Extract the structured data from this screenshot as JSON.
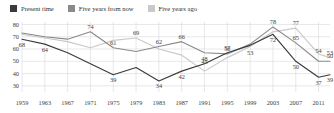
{
  "legend": {
    "items": [
      {
        "label": "Present time",
        "color": "#3b3b3b",
        "key": "present"
      },
      {
        "label": "Five years from now",
        "color": "#8a8a8a",
        "key": "future"
      },
      {
        "label": "Five years ago",
        "color": "#c9c9c9",
        "key": "past"
      }
    ]
  },
  "chart_data": {
    "type": "line",
    "title": "",
    "subtitle": "",
    "xlabel": "",
    "ylabel": "",
    "grid": true,
    "legend_position": "top-left",
    "xlim": [
      1959,
      2013
    ],
    "ylim": [
      25,
      82
    ],
    "yticks": [
      30,
      40,
      50,
      60,
      70,
      80
    ],
    "xticks": [
      1959,
      1963,
      1967,
      1971,
      1975,
      1979,
      1983,
      1987,
      1991,
      1995,
      1999,
      2003,
      2007,
      2011
    ],
    "x": [
      1959,
      1963,
      1967,
      1971,
      1975,
      1979,
      1983,
      1987,
      1991,
      1995,
      1999,
      2003,
      2007,
      2011,
      2013
    ],
    "series": [
      {
        "name": "Present time",
        "color": "#3b3b3b",
        "values": [
          68,
          64,
          57,
          48,
          39,
          45,
          34,
          42,
          48,
          57,
          63,
          72,
          50,
          37,
          39
        ]
      },
      {
        "name": "Five years from now",
        "color": "#8a8a8a",
        "values": [
          73,
          70,
          68,
          74,
          61,
          58,
          62,
          66,
          57,
          56,
          64,
          78,
          65,
          50,
          50
        ]
      },
      {
        "name": "Five years ago",
        "color": "#c9c9c9",
        "values": [
          72,
          69,
          66,
          61,
          67,
          69,
          60,
          55,
          42,
          53,
          62,
          74,
          77,
          56,
          53
        ]
      }
    ],
    "point_labels": [
      {
        "series": "Present time",
        "year": 1959,
        "value": 68,
        "text": "68"
      },
      {
        "series": "Present time",
        "year": 1963,
        "value": 64,
        "text": "64"
      },
      {
        "series": "Present time",
        "year": 1975,
        "value": 39,
        "text": "39"
      },
      {
        "series": "Present time",
        "year": 1983,
        "value": 34,
        "text": "34"
      },
      {
        "series": "Present time",
        "year": 1987,
        "value": 42,
        "text": "42"
      },
      {
        "series": "Present time",
        "year": 2003,
        "value": 72,
        "text": "72"
      },
      {
        "series": "Present time",
        "year": 2007,
        "value": 50,
        "text": "50"
      },
      {
        "series": "Present time",
        "year": 2011,
        "value": 37,
        "text": "37"
      },
      {
        "series": "Present time",
        "year": 2013,
        "value": 39,
        "text": "39"
      },
      {
        "series": "Five years from now",
        "year": 1971,
        "value": 74,
        "text": "74"
      },
      {
        "series": "Five years from now",
        "year": 1975,
        "value": 61,
        "text": "61"
      },
      {
        "series": "Five years from now",
        "year": 1987,
        "value": 66,
        "text": "66"
      },
      {
        "series": "Five years from now",
        "year": 1995,
        "value": 56,
        "text": "56"
      },
      {
        "series": "Five years from now",
        "year": 2003,
        "value": 78,
        "text": "78"
      },
      {
        "series": "Five years from now",
        "year": 2007,
        "value": 65,
        "text": "65"
      },
      {
        "series": "Five years from now",
        "year": 2013,
        "value": 50,
        "text": "50"
      },
      {
        "series": "Five years ago",
        "year": 1979,
        "value": 69,
        "text": "69"
      },
      {
        "series": "Five years ago",
        "year": 1983,
        "value": 62,
        "text": "62"
      },
      {
        "series": "Five years ago",
        "year": 1991,
        "value": 45,
        "text": "45"
      },
      {
        "series": "Five years ago",
        "year": 1991,
        "value": 48,
        "text": "48"
      },
      {
        "series": "Five years ago",
        "year": 1999,
        "value": 53,
        "text": "53"
      },
      {
        "series": "Five years ago",
        "year": 1995,
        "value": 57,
        "text": "57"
      },
      {
        "series": "Five years ago",
        "year": 2007,
        "value": 77,
        "text": "77"
      },
      {
        "series": "Five years ago",
        "year": 2011,
        "value": 54,
        "text": "54"
      },
      {
        "series": "Five years ago",
        "year": 2013,
        "value": 53,
        "text": "53"
      }
    ]
  },
  "axis": {
    "y_labels": [
      "80",
      "70",
      "60",
      "50",
      "40",
      "30"
    ],
    "x_labels": [
      "1959",
      "1963",
      "1967",
      "1971",
      "1975",
      "1979",
      "1983",
      "1987",
      "1991",
      "1995",
      "1999",
      "2003",
      "2007",
      "2011"
    ]
  },
  "colors": {
    "grid": "#d9d9d9",
    "axis_text": "#3d3d3d",
    "background": "#ffffff"
  }
}
